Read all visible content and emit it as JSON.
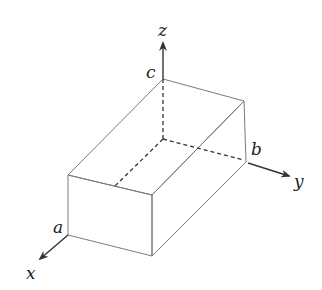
{
  "diagram": {
    "axes": {
      "x": "x",
      "y": "y",
      "z": "z"
    },
    "dimensions": {
      "a": "a",
      "b": "b",
      "c": "c"
    },
    "colors": {
      "face_top": "#ececec",
      "face_front": "#e3e3e3",
      "face_right": "#eaeaea",
      "edge": "#7a7a7a",
      "axis": "#333333"
    }
  }
}
